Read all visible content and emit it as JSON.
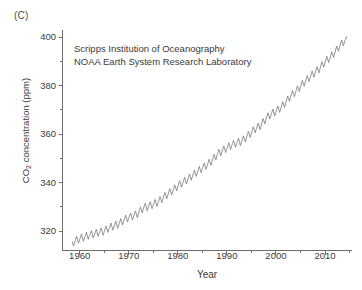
{
  "figure": {
    "panel_label": "(C)",
    "background_color": "#ffffff",
    "line_color": "#707070",
    "axis_color": "#6e6e6e",
    "text_color": "#3a3a3a"
  },
  "annotation": {
    "line1": "Scripps Institution of Oceanography",
    "line2": "NOAA Earth System Research Laboratory"
  },
  "chart_data": {
    "type": "line",
    "title": "",
    "subtitle": "",
    "xlabel": "Year",
    "ylabel": "CO2 concentration (ppm)",
    "ylabel_rich": {
      "prefix": "CO",
      "subscript": "2",
      "suffix": " concentration (ppm)"
    },
    "xlim": [
      1956.5,
      2015.5
    ],
    "ylim": [
      312,
      403
    ],
    "xticks": [
      1960,
      1970,
      1980,
      1990,
      2000,
      2010
    ],
    "xtick_labels": [
      "1960",
      "1970",
      "1980",
      "1990",
      "2000",
      "2010"
    ],
    "xminor_ticks": [
      1965,
      1975,
      1985,
      1995,
      2005,
      2015
    ],
    "yticks": [
      320,
      340,
      360,
      380,
      400
    ],
    "ytick_labels": [
      "320",
      "340",
      "360",
      "380",
      "400"
    ],
    "yminor_ticks": [
      330,
      350,
      370,
      390
    ],
    "grid": false,
    "legend": null,
    "annotations": [
      "Scripps Institution of Oceanography",
      "NOAA Earth System Research Laboratory"
    ],
    "series": [
      {
        "name": "Mauna Loa atmospheric CO2 (monthly mean)",
        "seasonal_amplitude_ppm": 3.2,
        "x": [
          1958.5,
          1959,
          1960,
          1961,
          1962,
          1963,
          1964,
          1965,
          1966,
          1967,
          1968,
          1969,
          1970,
          1971,
          1972,
          1973,
          1974,
          1975,
          1976,
          1977,
          1978,
          1979,
          1980,
          1981,
          1982,
          1983,
          1984,
          1985,
          1986,
          1987,
          1988,
          1989,
          1990,
          1991,
          1992,
          1993,
          1994,
          1995,
          1996,
          1997,
          1998,
          1999,
          2000,
          2001,
          2002,
          2003,
          2004,
          2005,
          2006,
          2007,
          2008,
          2009,
          2010,
          2011,
          2012,
          2013,
          2014
        ],
        "values": [
          315.0,
          315.9,
          316.9,
          317.6,
          318.4,
          318.9,
          319.6,
          320.0,
          321.4,
          322.2,
          323.0,
          324.6,
          325.7,
          326.3,
          327.5,
          329.7,
          330.2,
          331.1,
          332.0,
          333.8,
          335.4,
          336.8,
          338.7,
          340.1,
          341.4,
          343.0,
          344.6,
          346.0,
          347.4,
          349.2,
          351.6,
          353.1,
          354.4,
          355.6,
          356.4,
          357.1,
          358.8,
          360.8,
          362.6,
          363.8,
          366.6,
          368.3,
          369.5,
          371.0,
          373.2,
          375.8,
          377.5,
          379.8,
          381.9,
          383.8,
          385.6,
          387.4,
          389.9,
          391.6,
          393.8,
          396.5,
          398.6
        ]
      }
    ]
  }
}
